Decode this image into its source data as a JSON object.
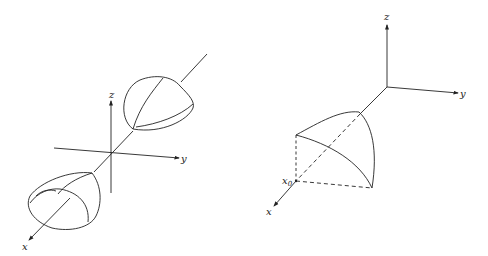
{
  "figure_left": {
    "description": "Two-sheeted hyperboloid along x-axis",
    "axes": {
      "z_label": "z",
      "y_label": "y",
      "x_label": "x"
    }
  },
  "figure_right": {
    "description": "Region bounded by surface above triangle in first octant",
    "axes": {
      "z_label": "z",
      "y_label": "y",
      "x_label": "x"
    },
    "point_label": "x",
    "point_subscript": "0"
  },
  "colors": {
    "stroke": "#222222",
    "background": "#ffffff"
  }
}
